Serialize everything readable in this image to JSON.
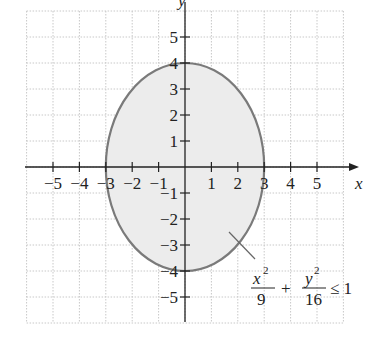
{
  "chart_data": {
    "type": "area",
    "title": "",
    "xlabel": "x",
    "ylabel": "y",
    "xlim": [
      -6,
      6
    ],
    "ylim": [
      -6,
      6
    ],
    "grid": true,
    "x_ticks": [
      -5,
      -4,
      -3,
      -2,
      -1,
      1,
      2,
      3,
      4,
      5
    ],
    "y_ticks": [
      -5,
      -4,
      -3,
      -2,
      -1,
      1,
      2,
      3,
      4,
      5
    ],
    "x_tick_labels": [
      "−5",
      "−4",
      "−3",
      "−2",
      "−1",
      "1",
      "2",
      "3",
      "4",
      "5"
    ],
    "y_tick_labels": [
      "−5",
      "−4",
      "−3",
      "−2",
      "−1",
      "1",
      "2",
      "3",
      "4",
      "5"
    ],
    "region": {
      "shape": "ellipse",
      "center": [
        0,
        0
      ],
      "semi_axis_x": 3,
      "semi_axis_y": 4,
      "inequality": "x^2/9 + y^2/16 <= 1",
      "boundary": "solid",
      "fill": "shaded"
    },
    "annotation": {
      "text": "x²/9 + y²/16 ≤ 1",
      "points_to": [
        1.6,
        -2.1
      ]
    }
  },
  "colors": {
    "fill": "#ececec",
    "boundary": "#7a7a7a",
    "axis": "#222222",
    "grid": "#c8c8c8"
  },
  "labels": {
    "x_axis": "x",
    "y_axis": "y",
    "ann_x_num": "x",
    "ann_x_exp": "2",
    "ann_x_den": "9",
    "ann_plus": "+",
    "ann_y_num": "y",
    "ann_y_exp": "2",
    "ann_y_den": "16",
    "ann_rel": "≤ 1"
  }
}
